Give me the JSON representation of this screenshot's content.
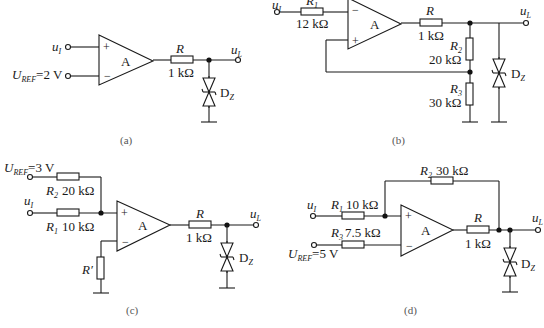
{
  "figure": {
    "panels": [
      {
        "id": "a",
        "caption": "(a)",
        "input_label": "u",
        "input_sub": "I",
        "ref_label": "U",
        "ref_sub": "REF",
        "ref_value": "=2 V",
        "opamp_label": "A",
        "plus": "+",
        "minus": "−",
        "resistor_R": "R",
        "resistor_R_value": "1 kΩ",
        "diode_label": "D",
        "diode_sub": "Z",
        "output_label": "u",
        "output_sub": "L"
      },
      {
        "id": "b",
        "caption": "(b)",
        "input_label": "u",
        "input_sub": "I",
        "r1_label": "R",
        "r1_sub": "1",
        "r1_value": "12 kΩ",
        "opamp_label": "A",
        "plus": "+",
        "minus": "−",
        "resistor_R": "R",
        "resistor_R_value": "1 kΩ",
        "r2_label": "R",
        "r2_sub": "2",
        "r2_value": "20 kΩ",
        "r3_label": "R",
        "r3_sub": "3",
        "r3_value": "30 kΩ",
        "diode_label": "D",
        "diode_sub": "Z",
        "output_label": "u",
        "output_sub": "L"
      },
      {
        "id": "c",
        "caption": "(c)",
        "ref_label": "U",
        "ref_sub": "REF",
        "ref_value": "=3 V",
        "input_label": "u",
        "input_sub": "I",
        "r2_label": "R",
        "r2_sub": "2",
        "r2_value": "20 kΩ",
        "r1_label": "R",
        "r1_sub": "1",
        "r1_value": "10 kΩ",
        "rprime_label": "R′",
        "opamp_label": "A",
        "plus": "+",
        "minus": "−",
        "resistor_R": "R",
        "resistor_R_value": "1 kΩ",
        "diode_label": "D",
        "diode_sub": "Z",
        "output_label": "u",
        "output_sub": "L"
      },
      {
        "id": "d",
        "caption": "(d)",
        "input_label": "u",
        "input_sub": "I",
        "r1_label": "R",
        "r1_sub": "1",
        "r1_value": "10 kΩ",
        "r2_label": "R",
        "r2_sub": "2",
        "r2_value": "30 kΩ",
        "r3_label": "R",
        "r3_sub": "3",
        "r3_value": "7.5 kΩ",
        "ref_label": "U",
        "ref_sub": "REF",
        "ref_value": "=5 V",
        "opamp_label": "A",
        "plus": "+",
        "minus": "−",
        "resistor_R": "R",
        "resistor_R_value": "1 kΩ",
        "diode_label": "D",
        "diode_sub": "Z",
        "output_label": "u",
        "output_sub": "L"
      }
    ]
  }
}
